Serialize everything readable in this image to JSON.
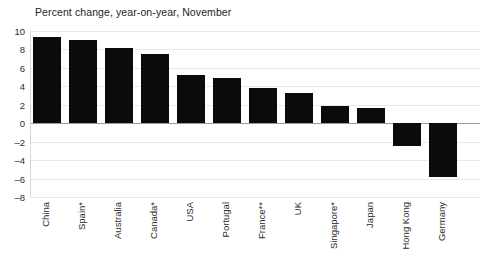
{
  "chart_data": {
    "type": "bar",
    "title": "Percent change, year-on-year, November",
    "xlabel": "",
    "ylabel": "",
    "ylim": [
      -8,
      10
    ],
    "ytick_step": 2,
    "yticks": [
      "10",
      "8",
      "6",
      "4",
      "2",
      "0",
      "–2",
      "–4",
      "–6",
      "–8"
    ],
    "ytick_values": [
      10,
      8,
      6,
      4,
      2,
      0,
      -2,
      -4,
      -6,
      -8
    ],
    "grid": true,
    "legend": "none",
    "bar_color": "#0b0b0b",
    "categories": [
      "China",
      "Spain*",
      "Australia",
      "Canada*",
      "USA",
      "Portugal",
      "France**",
      "UK",
      "Singapore*",
      "Japan",
      "Hong Kong",
      "Germany"
    ],
    "values": [
      9.3,
      9.0,
      8.2,
      7.5,
      5.2,
      4.9,
      3.8,
      3.3,
      1.9,
      1.6,
      -2.5,
      -5.8
    ]
  }
}
